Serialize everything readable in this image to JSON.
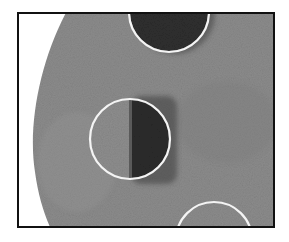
{
  "image": {
    "description": "Grayscale micrograph-style image of a textured grey disk with three white circular outlines marking dark spots",
    "frame": {
      "x": 17,
      "y": 12,
      "width": 258,
      "height": 216,
      "border_color": "#111111"
    },
    "colors": {
      "background": "#ffffff",
      "disk": "#8a8a8a",
      "disk_dark_texture": "#7a7a7a",
      "spot_dark": "#2e2e2e",
      "ring": "#f4f4f4"
    },
    "circles": [
      {
        "id": "top-circle",
        "cx": 152,
        "cy": 0,
        "r": 40,
        "fill": "dark"
      },
      {
        "id": "middle-circle",
        "cx": 113,
        "cy": 127,
        "r": 40,
        "fill": "half-dark-right",
        "split_x": 114
      },
      {
        "id": "bottom-circle",
        "cx": 197,
        "cy": 228,
        "r": 38,
        "fill": "grey"
      }
    ]
  }
}
